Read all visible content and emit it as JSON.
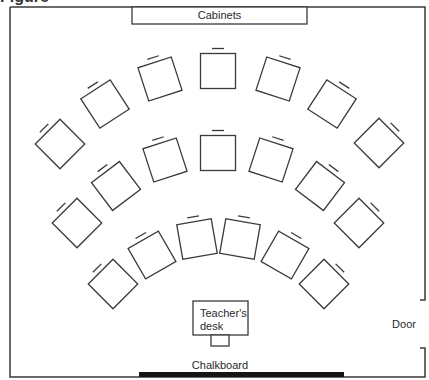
{
  "title_fragment": "Figure",
  "room": {
    "labels": {
      "cabinets": "Cabinets",
      "teachers_desk_line1": "Teacher's",
      "teachers_desk_line2": "desk",
      "door": "Door",
      "chalkboard": "Chalkboard"
    },
    "colors": {
      "line": "#3a3a3a",
      "chalkboard": "#151515",
      "background": "#ffffff"
    },
    "seating": {
      "rows": [
        {
          "name": "back",
          "count": 7,
          "angles_deg": [
            -45,
            -33,
            -18,
            0,
            18,
            33,
            45
          ]
        },
        {
          "name": "middle",
          "count": 7,
          "angles_deg": [
            -45,
            -37,
            -18,
            0,
            18,
            37,
            45
          ]
        },
        {
          "name": "front",
          "count": 6,
          "angles_deg": [
            -45,
            -30,
            -10,
            10,
            30,
            45
          ]
        }
      ],
      "total_student_desks": 20
    }
  }
}
